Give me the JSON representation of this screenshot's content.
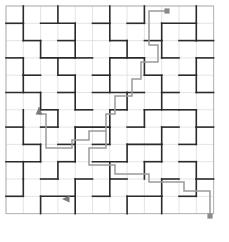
{
  "figure": {
    "title": "",
    "type": "maze-tiling-puzzle"
  },
  "canvas": {
    "width": 229,
    "height": 242,
    "background_color": "#ffffff"
  },
  "grid": {
    "origin_x": 6,
    "origin_y": 6,
    "cell_size": 17.3,
    "columns": 12,
    "rows": 12,
    "line_color": "#d8d8d8",
    "line_width": 0.7
  },
  "border": {
    "color": "#b4b4b4",
    "width": 1
  },
  "walls": {
    "color": "#2b2b2b",
    "width": 1.6,
    "horizontal": [
      [
        0,
        1,
        1
      ],
      [
        2,
        1,
        2
      ],
      [
        5,
        1,
        1
      ],
      [
        7,
        1,
        1
      ],
      [
        9,
        1,
        2
      ],
      [
        1,
        2,
        1
      ],
      [
        3,
        2,
        1
      ],
      [
        6,
        2,
        1
      ],
      [
        8,
        2,
        1
      ],
      [
        10,
        2,
        1
      ],
      [
        11,
        2,
        1
      ],
      [
        0,
        3,
        1
      ],
      [
        2,
        3,
        2
      ],
      [
        4,
        3,
        1
      ],
      [
        6,
        3,
        2
      ],
      [
        9,
        3,
        1
      ],
      [
        11,
        3,
        1
      ],
      [
        1,
        4,
        1
      ],
      [
        3,
        4,
        1
      ],
      [
        5,
        4,
        1
      ],
      [
        8,
        4,
        1
      ],
      [
        10,
        4,
        1
      ],
      [
        0,
        5,
        2
      ],
      [
        3,
        5,
        1
      ],
      [
        5,
        5,
        2
      ],
      [
        7,
        5,
        1
      ],
      [
        9,
        5,
        1
      ],
      [
        11,
        5,
        1
      ],
      [
        2,
        6,
        1
      ],
      [
        4,
        6,
        1
      ],
      [
        6,
        6,
        1
      ],
      [
        8,
        6,
        2
      ],
      [
        10,
        6,
        1
      ],
      [
        0,
        7,
        1
      ],
      [
        2,
        7,
        1
      ],
      [
        4,
        7,
        2
      ],
      [
        7,
        7,
        1
      ],
      [
        9,
        7,
        1
      ],
      [
        11,
        7,
        1
      ],
      [
        1,
        8,
        1
      ],
      [
        3,
        8,
        1
      ],
      [
        5,
        8,
        1
      ],
      [
        7,
        8,
        2
      ],
      [
        10,
        8,
        1
      ],
      [
        0,
        9,
        2
      ],
      [
        3,
        9,
        1
      ],
      [
        5,
        9,
        2
      ],
      [
        8,
        9,
        1
      ],
      [
        10,
        9,
        1
      ],
      [
        2,
        10,
        1
      ],
      [
        4,
        10,
        1
      ],
      [
        6,
        10,
        1
      ],
      [
        9,
        10,
        1
      ],
      [
        11,
        10,
        1
      ],
      [
        0,
        11,
        1
      ],
      [
        2,
        11,
        2
      ],
      [
        5,
        11,
        1
      ],
      [
        7,
        11,
        2
      ],
      [
        10,
        11,
        1
      ]
    ],
    "vertical": [
      [
        1,
        0,
        1
      ],
      [
        3,
        0,
        1
      ],
      [
        6,
        0,
        1
      ],
      [
        8,
        0,
        1
      ],
      [
        11,
        0,
        1
      ],
      [
        1,
        1,
        1
      ],
      [
        4,
        1,
        1
      ],
      [
        6,
        1,
        1
      ],
      [
        9,
        1,
        1
      ],
      [
        11,
        1,
        1
      ],
      [
        2,
        2,
        1
      ],
      [
        4,
        2,
        1
      ],
      [
        7,
        2,
        1
      ],
      [
        9,
        2,
        1
      ],
      [
        1,
        3,
        1
      ],
      [
        3,
        3,
        1
      ],
      [
        6,
        3,
        1
      ],
      [
        8,
        3,
        1
      ],
      [
        11,
        3,
        1
      ],
      [
        1,
        4,
        1
      ],
      [
        4,
        4,
        1
      ],
      [
        6,
        4,
        1
      ],
      [
        9,
        4,
        1
      ],
      [
        11,
        4,
        1
      ],
      [
        2,
        5,
        1
      ],
      [
        4,
        5,
        1
      ],
      [
        7,
        5,
        1
      ],
      [
        9,
        5,
        1
      ],
      [
        1,
        6,
        1
      ],
      [
        3,
        6,
        1
      ],
      [
        6,
        6,
        1
      ],
      [
        8,
        6,
        1
      ],
      [
        11,
        6,
        1
      ],
      [
        1,
        7,
        1
      ],
      [
        4,
        7,
        1
      ],
      [
        6,
        7,
        1
      ],
      [
        9,
        7,
        1
      ],
      [
        11,
        7,
        1
      ],
      [
        2,
        8,
        1
      ],
      [
        4,
        8,
        1
      ],
      [
        7,
        8,
        1
      ],
      [
        9,
        8,
        1
      ],
      [
        1,
        9,
        1
      ],
      [
        3,
        9,
        1
      ],
      [
        6,
        9,
        1
      ],
      [
        8,
        9,
        1
      ],
      [
        11,
        9,
        1
      ],
      [
        1,
        10,
        1
      ],
      [
        4,
        10,
        1
      ],
      [
        6,
        10,
        1
      ],
      [
        9,
        10,
        1
      ],
      [
        11,
        10,
        1
      ],
      [
        2,
        11,
        1
      ],
      [
        4,
        11,
        1
      ],
      [
        7,
        11,
        1
      ],
      [
        9,
        11,
        1
      ]
    ]
  },
  "path": {
    "color": "#9a9a9a",
    "width": 1.5,
    "points": [
      [
        167,
        11
      ],
      [
        149,
        11
      ],
      [
        149,
        45
      ],
      [
        158,
        45
      ],
      [
        158,
        62
      ],
      [
        141,
        62
      ],
      [
        141,
        79
      ],
      [
        132,
        79
      ],
      [
        132,
        96
      ],
      [
        115,
        96
      ],
      [
        115,
        114
      ],
      [
        106,
        114
      ],
      [
        106,
        131
      ],
      [
        89,
        131
      ],
      [
        89,
        140
      ],
      [
        72,
        140
      ],
      [
        72,
        148
      ],
      [
        46,
        148
      ],
      [
        46,
        114
      ],
      [
        39,
        114
      ],
      [
        39,
        107
      ]
    ],
    "branch_points": [
      [
        106,
        131
      ],
      [
        106,
        148
      ],
      [
        89,
        148
      ],
      [
        89,
        165
      ],
      [
        115,
        165
      ],
      [
        115,
        174
      ],
      [
        149,
        174
      ],
      [
        149,
        182
      ],
      [
        184,
        182
      ],
      [
        184,
        191
      ],
      [
        210,
        191
      ],
      [
        210,
        216
      ]
    ]
  },
  "markers": {
    "start_dot": {
      "label": "start-dot",
      "x": 167,
      "y": 11,
      "radius": 2.6,
      "color": "#8a8a8a"
    },
    "end_dot": {
      "label": "end-dot",
      "x": 210,
      "y": 216,
      "radius": 2.6,
      "color": "#8a8a8a"
    },
    "arrow_up": {
      "label": "arrow-up",
      "x": 39,
      "y": 107,
      "direction": "up",
      "color": "#7a7a7a"
    },
    "arrow_left": {
      "label": "arrow-left",
      "x": 62,
      "y": 199,
      "direction": "left",
      "color": "#7a7a7a"
    }
  }
}
